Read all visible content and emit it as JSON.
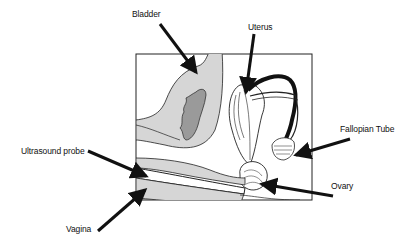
{
  "diagram": {
    "labels": {
      "bladder": "Bladder",
      "uterus": "Uterus",
      "fallopian_tube": "Fallopian Tube",
      "ultrasound_probe": "Ultrasound probe",
      "ovary": "Ovary",
      "vagina": "Vagina"
    },
    "colors": {
      "tissue_fill": "#d6d6d6",
      "bladder_inner": "#9a9a9a",
      "line": "#1a1a1a",
      "background": "#ffffff"
    }
  }
}
